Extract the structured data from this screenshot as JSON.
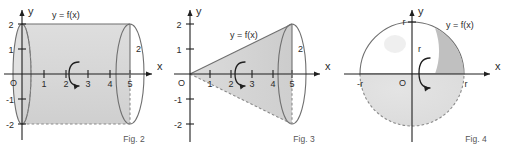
{
  "board": {
    "title": "Solids of revolution figures",
    "background_color": "#ffffff",
    "axis_color": "#1f1f1f",
    "outline_color": "#6f6f6f",
    "fill_light": "#e3e3e3",
    "fill_mid": "#d2d2d2",
    "fill_dark": "#b9b9b9"
  },
  "figures": [
    {
      "id": "cylinder",
      "caption": "Fig. 2",
      "curve_label": "y = f(x)",
      "axis_x_label": "x",
      "axis_y_label": "y",
      "origin_label": "O",
      "radius_label": "2",
      "x_ticks": [
        "1",
        "2",
        "3",
        "4",
        "5"
      ],
      "y_ticks": [
        "2",
        "1",
        "-1",
        "-2"
      ],
      "rotation_icon": "rotation-arrow-icon",
      "shape": "cylinder"
    },
    {
      "id": "cone",
      "caption": "Fig. 3",
      "curve_label": "y = f(x)",
      "axis_x_label": "x",
      "axis_y_label": "y",
      "origin_label": "O",
      "radius_label": "2",
      "x_ticks": [
        "1",
        "2",
        "3",
        "4",
        "5"
      ],
      "y_ticks": [
        "2",
        "1",
        "-1",
        "-2"
      ],
      "rotation_icon": "rotation-arrow-icon",
      "shape": "cone"
    },
    {
      "id": "sphere",
      "caption": "Fig. 4",
      "curve_label": "y = f(x)",
      "axis_x_label": "x",
      "axis_y_label": "y",
      "origin_label": "O",
      "radius_label_y": "r",
      "radius_label_inner": "r",
      "x_tick_left": "-r",
      "x_tick_right": "r",
      "rotation_icon": "rotation-arrow-icon",
      "shape": "sphere"
    }
  ]
}
